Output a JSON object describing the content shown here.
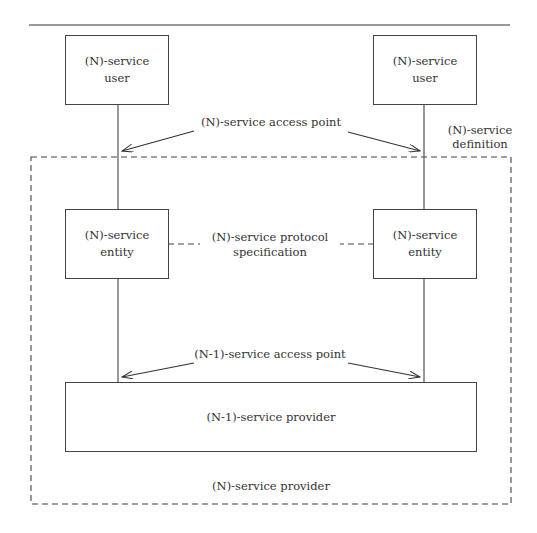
{
  "diagram": {
    "boxes": {
      "user_left": {
        "line1": "(N)-service",
        "line2": "user"
      },
      "user_right": {
        "line1": "(N)-service",
        "line2": "user"
      },
      "entity_left": {
        "line1": "(N)-service",
        "line2": "entity"
      },
      "entity_right": {
        "line1": "(N)-service",
        "line2": "entity"
      },
      "lower_provider": {
        "label": "(N-1)-service provider"
      }
    },
    "labels": {
      "access_point_top": "(N)-service access point",
      "service_definition_line1": "(N)-service",
      "service_definition_line2": "definition",
      "protocol_spec_line1": "(N)-service protocol",
      "protocol_spec_line2": "specification",
      "access_point_bottom": "(N-1)-service access point",
      "outer_provider": "(N)-service provider"
    },
    "colors": {
      "line": "#444444",
      "background": "#ffffff"
    }
  }
}
